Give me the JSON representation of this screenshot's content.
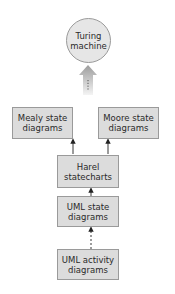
{
  "diagram": {
    "type": "hierarchy",
    "nodes": [
      {
        "id": "turing",
        "label": "Turing\nmachine",
        "shape": "circle"
      },
      {
        "id": "mealy",
        "label": "Mealy state\ndiagrams",
        "shape": "rect"
      },
      {
        "id": "moore",
        "label": "Moore state\ndiagrams",
        "shape": "rect"
      },
      {
        "id": "harel",
        "label": "Harel\nstatecharts",
        "shape": "rect"
      },
      {
        "id": "uml_state",
        "label": "UML state\ndiagrams",
        "shape": "rect"
      },
      {
        "id": "uml_activity",
        "label": "UML activity\ndiagrams",
        "shape": "rect"
      }
    ],
    "edges": [
      {
        "from": "mealy",
        "to": "turing",
        "style": "wide-gradient-arrow",
        "note": "generalized arrow with dotted center line"
      },
      {
        "from": "moore",
        "to": "turing",
        "style": "wide-gradient-arrow",
        "note": "generalized arrow with dotted center line"
      },
      {
        "from": "harel",
        "to": "mealy",
        "style": "solid"
      },
      {
        "from": "harel",
        "to": "moore",
        "style": "solid"
      },
      {
        "from": "uml_state",
        "to": "harel",
        "style": "solid"
      },
      {
        "from": "uml_activity",
        "to": "uml_state",
        "style": "dashed"
      }
    ]
  },
  "labels": {
    "turing": "Turing\nmachine",
    "mealy": "Mealy state\ndiagrams",
    "moore": "Moore state\ndiagrams",
    "harel": "Harel\nstatecharts",
    "uml_state": "UML state\ndiagrams",
    "uml_activity": "UML activity\ndiagrams"
  },
  "colors": {
    "node_fill": "#dcdcdc",
    "node_border": "#9a9a9a",
    "circle_fill": "#e6e6e6",
    "arrow": "#222222",
    "big_arrow_top": "#9c9c9c",
    "big_arrow_bottom": "#f4f4f4"
  }
}
